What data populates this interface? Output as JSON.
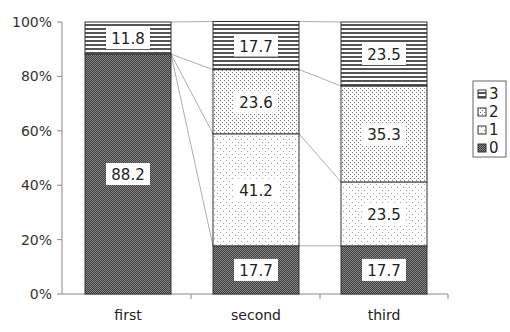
{
  "chart_data": {
    "type": "bar",
    "stacked": true,
    "percent_stacked": true,
    "title": "",
    "xlabel": "",
    "ylabel": "",
    "categories": [
      "first",
      "second",
      "third"
    ],
    "series": [
      {
        "name": "0",
        "values": [
          88.2,
          17.7,
          17.7
        ],
        "pattern": "dense-dark-checker"
      },
      {
        "name": "1",
        "values": [
          0,
          41.2,
          23.5
        ],
        "pattern": "sparse-dots"
      },
      {
        "name": "2",
        "values": [
          0,
          23.6,
          35.3
        ],
        "pattern": "dense-dots"
      },
      {
        "name": "3",
        "values": [
          11.8,
          17.7,
          23.5
        ],
        "pattern": "horizontal-stripes"
      }
    ],
    "data_labels": [
      {
        "category": "first",
        "series": "0",
        "text": "88.2"
      },
      {
        "category": "first",
        "series": "3",
        "text": "11.8"
      },
      {
        "category": "second",
        "series": "0",
        "text": "17.7"
      },
      {
        "category": "second",
        "series": "1",
        "text": "41.2"
      },
      {
        "category": "second",
        "series": "2",
        "text": "23.6"
      },
      {
        "category": "second",
        "series": "3",
        "text": "17.7"
      },
      {
        "category": "third",
        "series": "0",
        "text": "17.7"
      },
      {
        "category": "third",
        "series": "1",
        "text": "23.5"
      },
      {
        "category": "third",
        "series": "2",
        "text": "35.3"
      },
      {
        "category": "third",
        "series": "3",
        "text": "23.5"
      }
    ],
    "yticks": [
      "0%",
      "20%",
      "40%",
      "60%",
      "80%",
      "100%"
    ],
    "ylim": [
      0,
      100
    ],
    "grid": false,
    "series_lines": true,
    "legend": {
      "position": "right",
      "entries": [
        "3",
        "2",
        "1",
        "0"
      ]
    }
  }
}
